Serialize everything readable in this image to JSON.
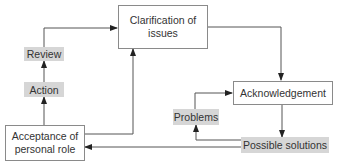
{
  "diagram": {
    "nodes": {
      "clarification": {
        "line1": "Clarification of",
        "line2": "issues"
      },
      "acknowledgement": {
        "label": "Acknowledgement"
      },
      "acceptance": {
        "line1": "Acceptance of",
        "line2": "personal role"
      }
    },
    "labels": {
      "review": "Review",
      "action": "Action",
      "problems": "Problems",
      "possible_solutions": "Possible solutions"
    },
    "edges": [
      {
        "from": "Acceptance of personal role",
        "to": "Action"
      },
      {
        "from": "Action",
        "to": "Review"
      },
      {
        "from": "Review",
        "to": "Clarification of issues"
      },
      {
        "from": "Acceptance of personal role",
        "to": "Clarification of issues"
      },
      {
        "from": "Clarification of issues",
        "to": "Acknowledgement"
      },
      {
        "from": "Acknowledgement",
        "to": "Possible solutions"
      },
      {
        "from": "Possible solutions",
        "to": "Problems"
      },
      {
        "from": "Problems",
        "to": "Acknowledgement"
      },
      {
        "from": "Possible solutions",
        "to": "Acceptance of personal role"
      }
    ],
    "colors": {
      "line": "#555555",
      "box_border": "#8a8a8a",
      "label_bg": "#d6d6d6",
      "text": "#333333"
    }
  }
}
